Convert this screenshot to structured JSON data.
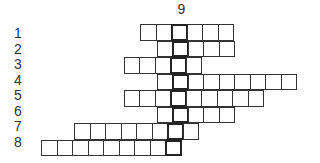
{
  "column_label": "9",
  "key_column": 8,
  "rows": [
    {
      "label": "1",
      "start": 6,
      "length": 6
    },
    {
      "label": "2",
      "start": 7,
      "length": 5
    },
    {
      "label": "3",
      "start": 5,
      "length": 5
    },
    {
      "label": "4",
      "start": 7,
      "length": 9
    },
    {
      "label": "5",
      "start": 5,
      "length": 9
    },
    {
      "label": "6",
      "start": 7,
      "length": 5
    },
    {
      "label": "7",
      "start": 2,
      "length": 8
    },
    {
      "label": "8",
      "start": 0,
      "length": 9
    }
  ],
  "colors": {
    "line": "#333333",
    "background": "#ffffff"
  }
}
